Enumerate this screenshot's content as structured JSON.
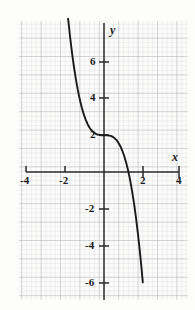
{
  "figure": {
    "kind": "cartesian-graph",
    "background_color": "#fdfdfc",
    "grid_color": "#c9c9cc",
    "axis_color": "#2a2a2a",
    "curve_color": "#1a1a1a",
    "label_color": "#1a1a1a"
  },
  "axes": {
    "x_label": "x",
    "y_label": "y",
    "x_ticks": [
      {
        "value": -4,
        "label": "-4"
      },
      {
        "value": -2,
        "label": "-2"
      },
      {
        "value": 2,
        "label": "2"
      },
      {
        "value": 4,
        "label": "4"
      }
    ],
    "y_ticks": [
      {
        "value": 6,
        "label": "6"
      },
      {
        "value": 4,
        "label": "4"
      },
      {
        "value": 2,
        "label": "2"
      },
      {
        "value": -2,
        "label": "-2"
      },
      {
        "value": -4,
        "label": "-4"
      },
      {
        "value": -6,
        "label": "-6"
      }
    ]
  },
  "chart_data": {
    "type": "line",
    "title": "",
    "xlabel": "x",
    "ylabel": "y",
    "xlim": [
      -4.45,
      4.65
    ],
    "ylim": [
      -7.3,
      7.75
    ],
    "grid": true,
    "legend": null,
    "categories": null,
    "x_ticks": [
      -4,
      -2,
      2,
      4
    ],
    "y_ticks": [
      6,
      4,
      2,
      -2,
      -4,
      -6
    ],
    "series": [
      {
        "name": "y = 2 - x^3",
        "x": [
          -1.85,
          -1.75,
          -1.65,
          -1.55,
          -1.45,
          -1.35,
          -1.25,
          -1.15,
          -1.05,
          -0.95,
          -0.85,
          -0.75,
          -0.65,
          -0.55,
          -0.45,
          -0.35,
          -0.25,
          -0.15,
          0.0,
          0.15,
          0.25,
          0.35,
          0.45,
          0.55,
          0.65,
          0.75,
          0.85,
          0.95,
          1.05,
          1.15,
          1.25,
          1.35,
          1.45,
          1.55,
          1.65,
          1.75,
          1.85,
          1.95,
          2.0
        ],
        "y": [
          8.33,
          7.36,
          6.49,
          5.72,
          5.05,
          4.46,
          3.95,
          3.52,
          3.16,
          2.86,
          2.61,
          2.42,
          2.27,
          2.17,
          2.09,
          2.04,
          2.02,
          2.0,
          2.0,
          2.0,
          1.98,
          1.96,
          1.91,
          1.83,
          1.73,
          1.58,
          1.39,
          1.14,
          0.84,
          0.48,
          0.05,
          -0.46,
          -1.05,
          -1.72,
          -2.49,
          -3.36,
          -4.33,
          -5.41,
          -6.0
        ]
      }
    ],
    "annotations": [
      {
        "text": "y-intercept at (0, 2)",
        "x": 0,
        "y": 2
      },
      {
        "text": "x-intercept near (1.26, 0)",
        "x": 1.26,
        "y": 0
      }
    ]
  },
  "geometry": {
    "origin_px": {
      "x": 104,
      "y": 172
    },
    "unit_px": {
      "x": 19.4,
      "y": 18.4
    },
    "grid_rect_px": {
      "left": 17,
      "top": 20,
      "right": 186,
      "bottom": 299
    },
    "x_axis_span_px": {
      "x1": 26,
      "x2": 179
    },
    "y_axis_span_px": {
      "y1": 23,
      "y2": 300
    }
  }
}
